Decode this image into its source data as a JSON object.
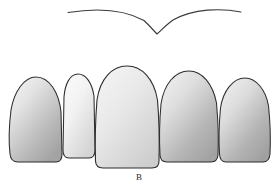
{
  "figure": {
    "caption": "B",
    "background_color": "#ffffff",
    "outline_color": "#2d2d2d",
    "width": 278,
    "height": 189
  },
  "smile_line": {
    "name": "smile-line-curve",
    "description": "Shallow arc across the upper arch dipping to a V at the midline",
    "stroke_color": "#3a3a3a",
    "stroke_width": 1.1,
    "left_end": {
      "x": 68,
      "y": 12
    },
    "right_end": {
      "x": 241,
      "y": 12
    },
    "apex_left": {
      "x": 108,
      "y": 9
    },
    "apex_right": {
      "x": 205,
      "y": 9
    },
    "dip_point": {
      "x": 157,
      "y": 34
    }
  },
  "teeth": [
    {
      "id": "tooth-1",
      "label": "Canine (left)",
      "position": "left-canine",
      "fill_light": "#f2f2f2",
      "fill_dark": "#a9a9a9",
      "gradient_angle": 145,
      "crown_top_y": 77,
      "crown_bottom_y": 162,
      "left_x": 10,
      "right_x": 62,
      "width": 52,
      "height": 85
    },
    {
      "id": "tooth-2",
      "label": "Lateral incisor (left)",
      "position": "left-lateral-incisor",
      "fill_light": "#fbfbfb",
      "fill_dark": "#d8d8d8",
      "gradient_angle": 145,
      "crown_top_y": 74,
      "crown_bottom_y": 158,
      "left_x": 63,
      "right_x": 94,
      "width": 31,
      "height": 84
    },
    {
      "id": "tooth-3",
      "label": "Central incisors",
      "position": "central-incisors",
      "fill_light": "#f0f0f0",
      "fill_dark": "#cfcfcf",
      "gradient_angle": 145,
      "crown_top_y": 66,
      "crown_bottom_y": 168,
      "left_x": 95,
      "right_x": 159,
      "width": 64,
      "height": 102
    },
    {
      "id": "tooth-4",
      "label": "Lateral incisor (right)",
      "position": "right-lateral-incisor",
      "fill_light": "#ededed",
      "fill_dark": "#a8a8a8",
      "gradient_angle": 145,
      "crown_top_y": 71,
      "crown_bottom_y": 162,
      "left_x": 160,
      "right_x": 218,
      "width": 58,
      "height": 91
    },
    {
      "id": "tooth-5",
      "label": "Canine (right)",
      "position": "right-canine",
      "fill_light": "#efefef",
      "fill_dark": "#a6a6a6",
      "gradient_angle": 145,
      "crown_top_y": 78,
      "crown_bottom_y": 162,
      "left_x": 219,
      "right_x": 270,
      "width": 51,
      "height": 84
    }
  ]
}
